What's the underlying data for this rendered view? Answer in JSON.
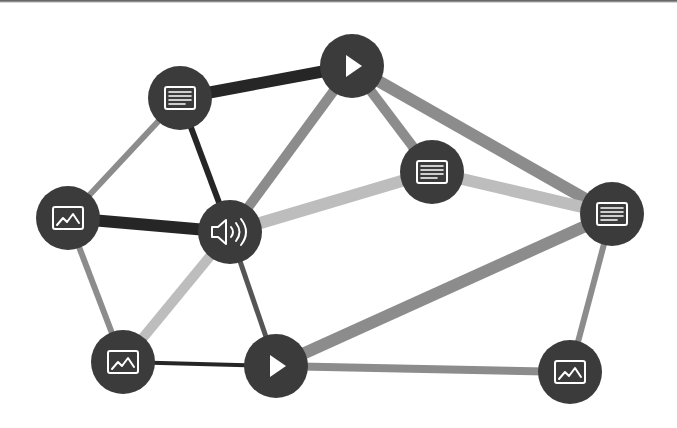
{
  "diagram": {
    "title": "",
    "type": "network-graph",
    "background": "#ffffff",
    "node_color": "#3b3b3b",
    "icon_color": "#ffffff",
    "node_radius": 32,
    "edge_colors": {
      "dark": "#262626",
      "darkgray": "#555555",
      "gray": "#8c8c8c",
      "light": "#bdbdbd"
    },
    "nodes": [
      {
        "id": "n1",
        "icon": "document-icon",
        "x": 180,
        "y": 98
      },
      {
        "id": "n2",
        "icon": "play-icon",
        "x": 352,
        "y": 66
      },
      {
        "id": "n3",
        "icon": "document-icon",
        "x": 432,
        "y": 172
      },
      {
        "id": "n4",
        "icon": "image-icon",
        "x": 68,
        "y": 218
      },
      {
        "id": "n5",
        "icon": "audio-icon",
        "x": 230,
        "y": 232
      },
      {
        "id": "n6",
        "icon": "document-icon",
        "x": 612,
        "y": 214
      },
      {
        "id": "n7",
        "icon": "image-icon",
        "x": 123,
        "y": 362
      },
      {
        "id": "n8",
        "icon": "play-icon",
        "x": 276,
        "y": 366
      },
      {
        "id": "n9",
        "icon": "image-icon",
        "x": 570,
        "y": 372
      }
    ],
    "edges": [
      {
        "from": "n1",
        "to": "n2",
        "shade": "dark",
        "width": 12
      },
      {
        "from": "n1",
        "to": "n5",
        "shade": "dark",
        "width": 6
      },
      {
        "from": "n1",
        "to": "n4",
        "shade": "gray",
        "width": 6
      },
      {
        "from": "n4",
        "to": "n5",
        "shade": "dark",
        "width": 12
      },
      {
        "from": "n2",
        "to": "n5",
        "shade": "gray",
        "width": 10
      },
      {
        "from": "n2",
        "to": "n3",
        "shade": "gray",
        "width": 10
      },
      {
        "from": "n2",
        "to": "n6",
        "shade": "gray",
        "width": 12
      },
      {
        "from": "n5",
        "to": "n3",
        "shade": "light",
        "width": 12
      },
      {
        "from": "n3",
        "to": "n6",
        "shade": "light",
        "width": 12
      },
      {
        "from": "n4",
        "to": "n7",
        "shade": "gray",
        "width": 6
      },
      {
        "from": "n5",
        "to": "n7",
        "shade": "light",
        "width": 10
      },
      {
        "from": "n5",
        "to": "n8",
        "shade": "darkgray",
        "width": 5
      },
      {
        "from": "n7",
        "to": "n8",
        "shade": "dark",
        "width": 4
      },
      {
        "from": "n8",
        "to": "n6",
        "shade": "gray",
        "width": 12
      },
      {
        "from": "n8",
        "to": "n9",
        "shade": "gray",
        "width": 8
      },
      {
        "from": "n6",
        "to": "n9",
        "shade": "gray",
        "width": 6
      }
    ]
  }
}
